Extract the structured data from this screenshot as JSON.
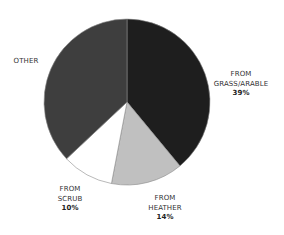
{
  "chart_data": {
    "type": "pie",
    "title": "",
    "start_angle_deg": 0,
    "direction": "clockwise",
    "slices": [
      {
        "name": "FROM GRASS/ARABLE",
        "value": 39,
        "label_lines": [
          "FROM",
          "GRASS/ARABLE"
        ],
        "pct_label": "39%",
        "color": "#1e1e1e"
      },
      {
        "name": "FROM HEATHER",
        "value": 14,
        "label_lines": [
          "FROM",
          "HEATHER"
        ],
        "pct_label": "14%",
        "color": "#c0c0c0"
      },
      {
        "name": "FROM SCRUB",
        "value": 10,
        "label_lines": [
          "FROM",
          "SCRUB"
        ],
        "pct_label": "10%",
        "color": "#ffffff"
      },
      {
        "name": "OTHER",
        "value": 37,
        "label_lines": [
          "OTHER"
        ],
        "pct_label": "",
        "color": "#3e3e3e"
      }
    ],
    "categories": [
      "FROM GRASS/ARABLE",
      "FROM HEATHER",
      "FROM SCRUB",
      "OTHER"
    ],
    "values": [
      39,
      14,
      10,
      37
    ],
    "legend": "none (direct labels)",
    "geometry": {
      "cx": 127,
      "cy": 102,
      "r": 83
    }
  },
  "labels": {
    "grass": {
      "line1": "FROM",
      "line2": "GRASS/ARABLE",
      "pct": "39%"
    },
    "heather": {
      "line1": "FROM",
      "line2": "HEATHER",
      "pct": "14%"
    },
    "scrub": {
      "line1": "FROM",
      "line2": "SCRUB",
      "pct": "10%"
    },
    "other": {
      "line1": "OTHER"
    }
  }
}
